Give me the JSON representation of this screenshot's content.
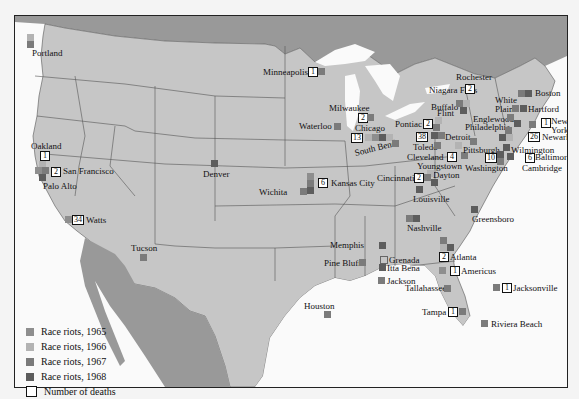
{
  "map": {
    "title": "Race riots in the United States, 1965-1968",
    "colors": {
      "land_us": "#c6c6c6",
      "land_foreign": "#999999",
      "water": "#fafafa",
      "border": "#555555",
      "y1965": "#8e8e8e",
      "y1966": "#b3b3b3",
      "y1967": "#7b7b7b",
      "y1968": "#5d5d5d"
    }
  },
  "legend": {
    "items": [
      {
        "label": "Race riots, 1965",
        "key": "y1965"
      },
      {
        "label": "Race riots, 1966",
        "key": "y1966"
      },
      {
        "label": "Race riots, 1967",
        "key": "y1967"
      },
      {
        "label": "Race riots, 1968",
        "key": "y1968"
      },
      {
        "label": "Number of deaths",
        "key": "deaths"
      }
    ]
  },
  "cities": {
    "portland": {
      "name": "Portland"
    },
    "oakland": {
      "name": "Oakland",
      "deaths": "1"
    },
    "san_francisco": {
      "name": "San Francisco",
      "deaths": "2"
    },
    "palo_alto": {
      "name": "Palo Alto"
    },
    "watts": {
      "name": "Watts",
      "deaths": "34"
    },
    "tucson": {
      "name": "Tucson"
    },
    "denver": {
      "name": "Denver"
    },
    "wichita": {
      "name": "Wichita"
    },
    "kansas_city": {
      "name": "Kansas City",
      "deaths": "6"
    },
    "minneapolis": {
      "name": "Minneapolis",
      "deaths": "1"
    },
    "waterloo": {
      "name": "Waterloo"
    },
    "milwaukee": {
      "name": "Milwaukee",
      "deaths": "2"
    },
    "chicago": {
      "name": "Chicago",
      "deaths": "13"
    },
    "south_bend": {
      "name": "South Bend"
    },
    "pontiac": {
      "name": "Pontiac",
      "deaths": "2"
    },
    "flint": {
      "name": "Flint"
    },
    "detroit": {
      "name": "Detroit",
      "deaths": "38"
    },
    "toledo": {
      "name": "Toledo"
    },
    "cleveland": {
      "name": "Cleveland",
      "deaths": "4"
    },
    "youngstown": {
      "name": "Youngstown"
    },
    "dayton": {
      "name": "Dayton"
    },
    "cincinnati": {
      "name": "Cincinnati",
      "deaths": "2"
    },
    "louisville": {
      "name": "Louisville"
    },
    "nashville": {
      "name": "Nashville"
    },
    "memphis": {
      "name": "Memphis"
    },
    "pine_bluff": {
      "name": "Pine Bluff"
    },
    "grenada": {
      "name": "Grenada"
    },
    "itta_bena": {
      "name": "Itta Bena"
    },
    "jackson": {
      "name": "Jackson"
    },
    "houston": {
      "name": "Houston"
    },
    "atlanta": {
      "name": "Atlanta",
      "deaths": "2"
    },
    "americus": {
      "name": "Americus",
      "deaths": "1"
    },
    "tallahassee": {
      "name": "Tallahassee"
    },
    "jacksonville": {
      "name": "Jacksonville",
      "deaths": "1"
    },
    "tampa": {
      "name": "Tampa",
      "deaths": "1"
    },
    "riviera_beach": {
      "name": "Riviera Beach"
    },
    "greensboro": {
      "name": "Greensboro"
    },
    "niagara_falls": {
      "name": "Niagara Falls"
    },
    "buffalo": {
      "name": "Buffalo"
    },
    "rochester": {
      "name": "Rochester",
      "deaths": "2"
    },
    "boston": {
      "name": "Boston"
    },
    "white_plains": {
      "name": "White Plains"
    },
    "hartford": {
      "name": "Hartford"
    },
    "englewood": {
      "name": "Englewood"
    },
    "new_york": {
      "name": "New York",
      "deaths": "1"
    },
    "newark": {
      "name": "Newark",
      "deaths": "26"
    },
    "philadelphia": {
      "name": "Philadelphia"
    },
    "pittsburgh": {
      "name": "Pittsburgh"
    },
    "wilmington": {
      "name": "Wilmington"
    },
    "baltimore": {
      "name": "Baltimore",
      "deaths": "6"
    },
    "washington": {
      "name": "Washington",
      "deaths": "10"
    },
    "cambridge": {
      "name": "Cambridge"
    }
  }
}
